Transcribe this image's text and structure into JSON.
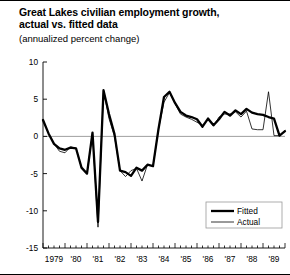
{
  "chart_data": {
    "type": "line",
    "title": "Great Lakes civilian employment growth,\nactual vs. fitted data",
    "subtitle": "(annualized percent change)",
    "xlabel": "",
    "ylabel": "",
    "ylim": [
      -15,
      10
    ],
    "yticks": [
      10,
      5,
      0,
      -5,
      -10,
      -15
    ],
    "ytick_labels": [
      "10",
      "5",
      "0",
      "-5",
      "-10",
      "-15"
    ],
    "xlim": [
      1979.0,
      1990.0
    ],
    "xticks": [
      1979,
      1980,
      1981,
      1982,
      1983,
      1984,
      1985,
      1986,
      1987,
      1988,
      1989,
      1990
    ],
    "xtick_labels": [
      "1979",
      "'80",
      "'81",
      "'82",
      "'83",
      "'84",
      "'85",
      "'86",
      "'87",
      "'88",
      "'89"
    ],
    "minor_tick_interval": 0.25,
    "grid": false,
    "zero_line": true,
    "legend_position": "bottom-right",
    "legend": [
      "Fitted",
      "Actual"
    ],
    "x": [
      1979.0,
      1979.25,
      1979.5,
      1979.75,
      1980.0,
      1980.25,
      1980.5,
      1980.75,
      1981.0,
      1981.25,
      1981.5,
      1981.75,
      1982.0,
      1982.25,
      1982.5,
      1982.75,
      1983.0,
      1983.25,
      1983.5,
      1983.75,
      1984.0,
      1984.25,
      1984.5,
      1984.75,
      1985.0,
      1985.25,
      1985.5,
      1985.75,
      1986.0,
      1986.25,
      1986.5,
      1986.75,
      1987.0,
      1987.25,
      1987.5,
      1987.75,
      1988.0,
      1988.25,
      1988.5,
      1988.75,
      1989.0,
      1989.25,
      1989.5,
      1989.75,
      1990.0
    ],
    "series": [
      {
        "name": "Fitted",
        "style": "thick",
        "color": "#000000",
        "width": 2.3,
        "values": [
          2.2,
          0.4,
          -1.0,
          -1.6,
          -1.8,
          -1.5,
          -1.6,
          -4.2,
          -5.0,
          0.5,
          -11.5,
          6.2,
          3.0,
          0.3,
          -4.6,
          -4.8,
          -5.3,
          -4.2,
          -4.6,
          -3.8,
          -4.0,
          1.0,
          5.3,
          6.0,
          4.5,
          3.3,
          2.8,
          2.6,
          2.3,
          1.3,
          2.4,
          1.5,
          2.3,
          3.3,
          2.8,
          3.5,
          3.0,
          3.7,
          3.2,
          3.0,
          2.9,
          2.6,
          2.4,
          0.1,
          0.7
        ]
      },
      {
        "name": "Actual",
        "style": "thin",
        "color": "#000000",
        "width": 0.8,
        "values": [
          2.2,
          0.4,
          -1.0,
          -2.0,
          -2.2,
          -1.4,
          -1.6,
          -4.2,
          -5.0,
          0.5,
          -12.2,
          6.2,
          2.4,
          0.0,
          -4.6,
          -5.4,
          -4.6,
          -4.3,
          -6.0,
          -3.8,
          -4.0,
          1.0,
          4.6,
          5.9,
          4.4,
          3.0,
          2.6,
          2.3,
          1.9,
          1.5,
          2.2,
          1.4,
          2.6,
          3.0,
          3.0,
          3.3,
          2.6,
          3.4,
          1.0,
          0.9,
          0.9,
          6.0,
          0.1,
          0.1,
          0.8
        ]
      }
    ]
  },
  "layout": {
    "plot_left": 43,
    "plot_right": 285,
    "plot_top": 62,
    "plot_bottom": 248
  }
}
